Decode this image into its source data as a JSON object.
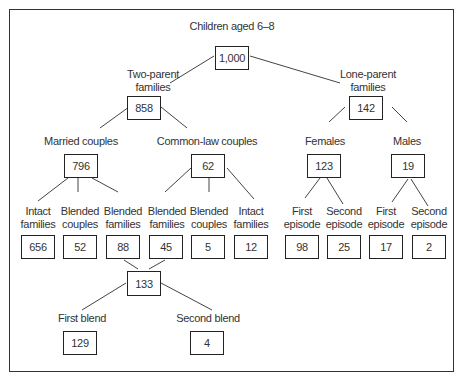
{
  "title": "Children aged 6–8",
  "nodes": {
    "root": {
      "label": "",
      "value": "1,000"
    },
    "two_parent": {
      "label1": "Two-parent",
      "label2": "families",
      "value": "858"
    },
    "lone_parent": {
      "label1": "Lone-parent",
      "label2": "families",
      "value": "142"
    },
    "married": {
      "label": "Married couples",
      "value": "796"
    },
    "common_law": {
      "label": "Common-law couples",
      "value": "62"
    },
    "females": {
      "label": "Females",
      "value": "123"
    },
    "males": {
      "label": "Males",
      "value": "19"
    },
    "leaves": [
      {
        "label1": "Intact",
        "label2": "families",
        "value": "656"
      },
      {
        "label1": "Blended",
        "label2": "couples",
        "value": "52"
      },
      {
        "label1": "Blended",
        "label2": "families",
        "value": "88"
      },
      {
        "label1": "Blended",
        "label2": "families",
        "value": "45"
      },
      {
        "label1": "Blended",
        "label2": "couples",
        "value": "5"
      },
      {
        "label1": "Intact",
        "label2": "families",
        "value": "12"
      },
      {
        "label1": "First",
        "label2": "episode",
        "value": "98"
      },
      {
        "label1": "Second",
        "label2": "episode",
        "value": "25"
      },
      {
        "label1": "First",
        "label2": "episode",
        "value": "17"
      },
      {
        "label1": "Second",
        "label2": "episode",
        "value": "2"
      }
    ],
    "blended_total": {
      "value": "133"
    },
    "first_blend": {
      "label": "First blend",
      "value": "129"
    },
    "second_blend": {
      "label": "Second blend",
      "value": "4"
    }
  }
}
